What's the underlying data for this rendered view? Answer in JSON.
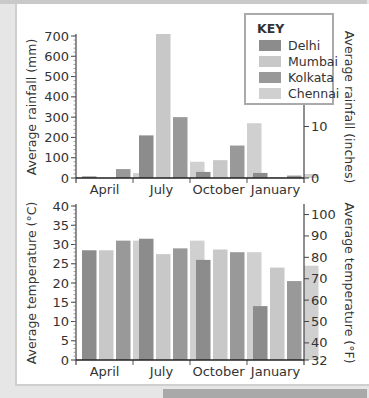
{
  "chart_data": [
    {
      "type": "bar",
      "title": "",
      "categories": [
        "April",
        "July",
        "October",
        "January"
      ],
      "series": [
        {
          "name": "Delhi",
          "values": [
            8,
            210,
            30,
            25
          ]
        },
        {
          "name": "Mumbai",
          "values": [
            2,
            710,
            88,
            3
          ]
        },
        {
          "name": "Kolkata",
          "values": [
            44,
            300,
            160,
            12
          ]
        },
        {
          "name": "Chennai",
          "values": [
            24,
            80,
            270,
            20
          ]
        }
      ],
      "ylabel": "Average rainfall (mm)",
      "ylim": [
        0,
        700
      ],
      "yticks": [
        "0",
        "100",
        "200",
        "300",
        "400",
        "500",
        "600",
        "700"
      ],
      "y2label": "Average rainfall (inches)",
      "y2lim": [
        0,
        27.56
      ],
      "y2ticks": [
        "0",
        "10",
        "20",
        "28"
      ],
      "grid": false,
      "legend": {
        "title": "KEY",
        "position": "top-right",
        "entries": [
          "Delhi",
          "Mumbai",
          "Kolkata",
          "Chennai"
        ]
      }
    },
    {
      "type": "bar",
      "title": "",
      "categories": [
        "April",
        "July",
        "October",
        "January"
      ],
      "series": [
        {
          "name": "Delhi",
          "values": [
            28.5,
            31.5,
            26,
            14
          ]
        },
        {
          "name": "Mumbai",
          "values": [
            28.5,
            27.5,
            28.7,
            24
          ]
        },
        {
          "name": "Kolkata",
          "values": [
            31,
            29,
            28,
            20.5
          ]
        },
        {
          "name": "Chennai",
          "values": [
            31,
            31,
            28,
            24.5
          ]
        }
      ],
      "ylabel": "Average temperature (°C)",
      "ylim": [
        0,
        40
      ],
      "yticks": [
        "0",
        "5",
        "10",
        "15",
        "20",
        "25",
        "30",
        "35",
        "40"
      ],
      "y2label": "Average temperature (°F)",
      "y2lim": [
        32,
        104
      ],
      "y2ticks": [
        "32",
        "40",
        "50",
        "60",
        "70",
        "80",
        "90",
        "100"
      ],
      "grid": false
    }
  ],
  "colors": {
    "Delhi": "#8c8c8c",
    "Mumbai": "#c8c8c8",
    "Kolkata": "#999999",
    "Chennai": "#d0d0d0"
  }
}
